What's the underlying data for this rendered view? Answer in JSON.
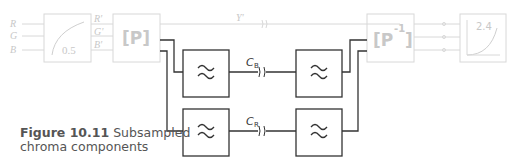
{
  "figure": {
    "caption_number": "Figure 10.11",
    "caption_title_line1": "Subsampled",
    "caption_title_line2": "chroma components"
  },
  "inputs": [
    "R",
    "G",
    "B"
  ],
  "gamma_encode": {
    "value": "0.5"
  },
  "primes": [
    "R'",
    "G'",
    "B'"
  ],
  "matrix": {
    "label": "[P]"
  },
  "inverse_matrix": {
    "label": "[P",
    "superscript": "-1",
    "close": "]"
  },
  "gamma_decode": {
    "value": "2.4"
  },
  "luma_label": "Y'",
  "chroma": [
    {
      "label": "C",
      "subscript": "B"
    },
    {
      "label": "C",
      "subscript": "R"
    }
  ],
  "filter_symbol": "≈",
  "colors": {
    "faded": "#d8d8d8",
    "faded_text": "#c8c8c8",
    "active": "#333333",
    "caption": "#555555"
  }
}
